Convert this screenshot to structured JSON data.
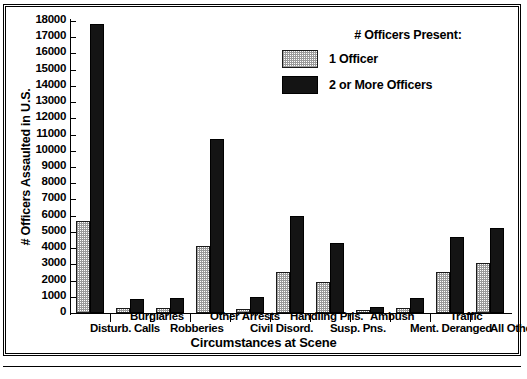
{
  "chart_data": {
    "type": "bar",
    "title": "",
    "xlabel": "Circumstances at Scene",
    "ylabel": "# Officers Assaulted in U.S.",
    "ylim": [
      0,
      18000
    ],
    "ytick_step": 1000,
    "grid": false,
    "legend_position": "top-right",
    "legend_title": "# Officers Present:",
    "categories": [
      "Disturb. Calls",
      "Burglaries",
      "Robberies",
      "Other Arrests",
      "Civil Disord.",
      "Handling Pris.",
      "Susp. Pns.",
      "Ambush",
      "Ment. Deranged",
      "Traffic",
      "All Other"
    ],
    "series": [
      {
        "name": "1 Officer",
        "values": [
          5700,
          300,
          280,
          4150,
          250,
          2550,
          1930,
          180,
          330,
          2500,
          3080
        ]
      },
      {
        "name": "2 or More Officers",
        "values": [
          17800,
          870,
          940,
          10700,
          990,
          6000,
          4320,
          350,
          930,
          4700,
          5270
        ]
      }
    ],
    "ytick_labels": [
      "18000",
      "17000",
      "16000",
      "15000",
      "14000",
      "13000",
      "12000",
      "11000",
      "10000",
      "9000",
      "8000",
      "7000",
      "6000",
      "5000",
      "4000",
      "3000",
      "2000",
      "1000",
      "0"
    ]
  },
  "axis": {
    "y_title": "# Officers Assaulted in U.S.",
    "x_title": "Circumstances at Scene"
  },
  "legend": {
    "title": "# Officers Present:",
    "entries": [
      {
        "label": "1 Officer",
        "swatch": "light-dotted"
      },
      {
        "label": "2 or More Officers",
        "swatch": "solid-black"
      }
    ]
  }
}
